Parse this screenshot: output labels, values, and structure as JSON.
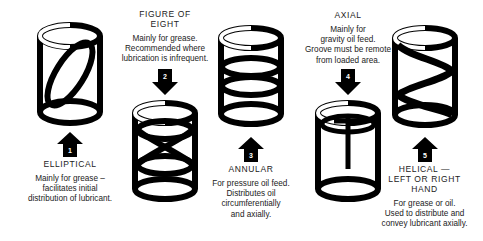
{
  "diagram": {
    "ink_color": "#000000",
    "background": "#ffffff",
    "items": [
      {
        "number": "1",
        "name": "ELLIPTICAL",
        "groove_icon": "elliptical-groove-cylinder",
        "arrow_icon": "arrow-up-icon",
        "arrow_direction": "up",
        "layout": "caption-below",
        "description": "Mainly for grease – facilitates initial distribution of lubricant.",
        "description_lines": [
          "Mainly for grease –",
          "facilitates initial",
          "distribution of lubricant."
        ],
        "heading_lines": [
          "ELLIPTICAL"
        ]
      },
      {
        "number": "2",
        "name": "FIGURE OF EIGHT",
        "groove_icon": "figure-of-eight-groove-cylinder",
        "arrow_icon": "arrow-down-icon",
        "arrow_direction": "down",
        "layout": "caption-above",
        "description": "Mainly for grease. Recommended where lubrication is infrequent.",
        "description_lines": [
          "Mainly for grease.",
          "Recommended where",
          "lubrication is infrequent."
        ],
        "heading_lines": [
          "FIGURE OF",
          "EIGHT"
        ]
      },
      {
        "number": "3",
        "name": "ANNULAR",
        "groove_icon": "annular-groove-cylinder",
        "arrow_icon": "arrow-up-icon",
        "arrow_direction": "up",
        "layout": "caption-below",
        "description": "For pressure oil feed. Distributes oil circumferentially and axially.",
        "description_lines": [
          "For pressure oil feed.",
          "Distributes oil",
          "circumferentially",
          "and axially."
        ],
        "heading_lines": [
          "ANNULAR"
        ]
      },
      {
        "number": "4",
        "name": "AXIAL",
        "groove_icon": "axial-groove-cylinder",
        "arrow_icon": "arrow-down-icon",
        "arrow_direction": "down",
        "layout": "caption-above",
        "description": "Mainly for gravity oil feed. Groove must be remote from loaded area.",
        "description_lines": [
          "Mainly for",
          "gravity oil feed.",
          "Groove must be remote",
          "from loaded area."
        ],
        "heading_lines": [
          "AXIAL"
        ]
      },
      {
        "number": "5",
        "name": "HELICAL — LEFT OR RIGHT HAND",
        "groove_icon": "helical-groove-cylinder",
        "arrow_icon": "arrow-up-icon",
        "arrow_direction": "up",
        "layout": "caption-below",
        "description": "For grease or oil. Used to distribute and convey lubricant axially.",
        "description_lines": [
          "For grease or oil.",
          "Used to distribute and",
          "convey lubricant axially."
        ],
        "heading_lines": [
          "HELICAL —",
          "LEFT OR RIGHT",
          "HAND"
        ]
      }
    ]
  }
}
